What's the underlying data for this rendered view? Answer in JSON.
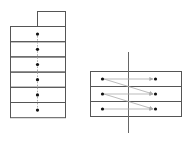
{
  "diagram": {
    "colors": {
      "stroke": "#555555",
      "dot": "#111111",
      "arrow": "#aaaaaa",
      "axis": "#666666",
      "background": "#ffffff"
    },
    "left_stack": {
      "tab": {
        "x": 37,
        "y": 11,
        "w": 28,
        "h": 15
      },
      "x": 10,
      "y": 26,
      "w": 55,
      "row_h": 15.2,
      "rows": 6,
      "dot_x": 37,
      "description": "Vertical stack of 6 cells, each with a centered dot linked vertically by dashed connectors"
    },
    "right_stack": {
      "x": 90,
      "y": 71,
      "w": 91,
      "row_h": 15,
      "rows": 3,
      "left_dot_x": 102,
      "right_dot_x": 155,
      "axis_x": 128,
      "axis_y1": 52,
      "axis_y2": 133,
      "arrows": [
        {
          "from": [
            0,
            "left"
          ],
          "to": [
            0,
            "right"
          ]
        },
        {
          "from": [
            0,
            "left"
          ],
          "to": [
            1,
            "right"
          ]
        },
        {
          "from": [
            1,
            "left"
          ],
          "to": [
            1,
            "right"
          ]
        },
        {
          "from": [
            1,
            "left"
          ],
          "to": [
            2,
            "right"
          ]
        },
        {
          "from": [
            2,
            "left"
          ],
          "to": [
            2,
            "right"
          ]
        }
      ],
      "description": "Three-row strip split by a vertical axis; dots on left connect by arrows to dots on the right in the same row and the row below"
    }
  }
}
